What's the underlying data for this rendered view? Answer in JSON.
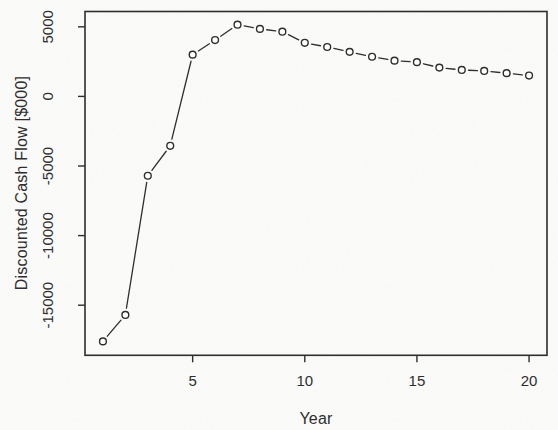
{
  "figure": {
    "background": "#fcfcfb",
    "ink_color": "#2e2e2e",
    "style": "scanned-base-R-plot"
  },
  "chart_data": {
    "type": "line",
    "title": "",
    "xlabel": "Year",
    "ylabel": "Discounted Cash Flow [$000]",
    "series": [
      {
        "name": "Discounted Cash Flow",
        "marker": "open-circle",
        "line_style": "solid-segments-with-marker-gaps",
        "x": [
          1,
          2,
          3,
          4,
          5,
          6,
          7,
          8,
          9,
          10,
          11,
          12,
          13,
          14,
          15,
          16,
          17,
          18,
          19,
          20
        ],
        "y": [
          -17600,
          -15700,
          -5700,
          -3550,
          3000,
          4050,
          5150,
          4850,
          4650,
          3850,
          3550,
          3200,
          2850,
          2570,
          2460,
          2070,
          1900,
          1830,
          1670,
          1500
        ]
      }
    ],
    "xlim": [
      0.2,
      20.8
    ],
    "ylim": [
      -18600,
      6100
    ],
    "x_ticks": [
      5,
      10,
      15,
      20
    ],
    "x_tick_labels": [
      "5",
      "10",
      "15",
      "20"
    ],
    "y_ticks": [
      5000,
      0,
      -5000,
      -10000,
      -15000
    ],
    "y_tick_labels": [
      "5000",
      "0",
      "-5000",
      "-10000",
      "-15000"
    ],
    "grid": false,
    "legend": null
  }
}
